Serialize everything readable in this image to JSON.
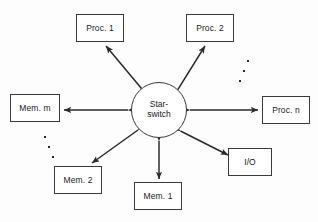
{
  "figure": {
    "background_color": "#fdfdfd",
    "line_color": "#2a2a2a",
    "box_border_color": "#3a3a3a",
    "text_color": "#1a1a1a"
  },
  "hub": {
    "name": "star-switch",
    "line1": "Star-",
    "line2": "switch",
    "cx": 159,
    "cy": 110,
    "r": 28
  },
  "nodes": [
    {
      "id": "proc-1",
      "label": "Proc. 1",
      "x": 76,
      "y": 14,
      "w": 48,
      "h": 28
    },
    {
      "id": "proc-2",
      "label": "Proc. 2",
      "x": 186,
      "y": 14,
      "w": 48,
      "h": 28
    },
    {
      "id": "proc-n",
      "label": "Proc. n",
      "x": 262,
      "y": 96,
      "w": 48,
      "h": 28
    },
    {
      "id": "io",
      "label": "I/O",
      "x": 228,
      "y": 148,
      "w": 44,
      "h": 28
    },
    {
      "id": "mem-1",
      "label": "Mem. 1",
      "x": 134,
      "y": 182,
      "w": 48,
      "h": 28
    },
    {
      "id": "mem-2",
      "label": "Mem. 2",
      "x": 54,
      "y": 166,
      "w": 48,
      "h": 28
    },
    {
      "id": "mem-m",
      "label": "Mem. m",
      "x": 10,
      "y": 94,
      "w": 50,
      "h": 28
    }
  ],
  "connectors": [
    {
      "id": "hub-to-proc-1",
      "from": "star-switch",
      "to": "proc-1",
      "style": "double-arrow"
    },
    {
      "id": "hub-to-proc-2",
      "from": "star-switch",
      "to": "proc-2",
      "style": "double-arrow"
    },
    {
      "id": "hub-to-proc-n",
      "from": "star-switch",
      "to": "proc-n",
      "style": "double-arrow"
    },
    {
      "id": "hub-to-io",
      "from": "star-switch",
      "to": "io",
      "style": "double-arrow"
    },
    {
      "id": "hub-to-mem-1",
      "from": "star-switch",
      "to": "mem-1",
      "style": "double-arrow"
    },
    {
      "id": "hub-to-mem-2",
      "from": "star-switch",
      "to": "mem-2",
      "style": "double-arrow"
    },
    {
      "id": "hub-to-mem-m",
      "from": "star-switch",
      "to": "mem-m",
      "style": "double-arrow"
    }
  ],
  "ellipses": [
    {
      "id": "ellipsis-processors",
      "meaning": "more processors between Proc. 2 and Proc. n",
      "dots": [
        {
          "x": 247,
          "y": 60
        },
        {
          "x": 243,
          "y": 70
        },
        {
          "x": 239,
          "y": 80
        }
      ]
    },
    {
      "id": "ellipsis-memories",
      "meaning": "more memories between Mem. m and Mem. 2",
      "dots": [
        {
          "x": 44,
          "y": 136
        },
        {
          "x": 48,
          "y": 146
        },
        {
          "x": 52,
          "y": 156
        }
      ]
    }
  ]
}
